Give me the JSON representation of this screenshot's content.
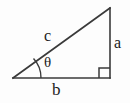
{
  "figure": {
    "background_color": "#fdfdfd",
    "stroke_color": "#3a3a3a",
    "text_color": "#1c1c1c",
    "labels": {
      "hypotenuse": "c",
      "opposite": "a",
      "adjacent": "b",
      "angle": "θ"
    },
    "geometry": {
      "vertex_left": "13,78",
      "vertex_bottom_right": "110,78",
      "vertex_top": "110,8",
      "right_angle_marker": "present at bottom-right vertex",
      "angle_arc": "at left vertex"
    }
  }
}
